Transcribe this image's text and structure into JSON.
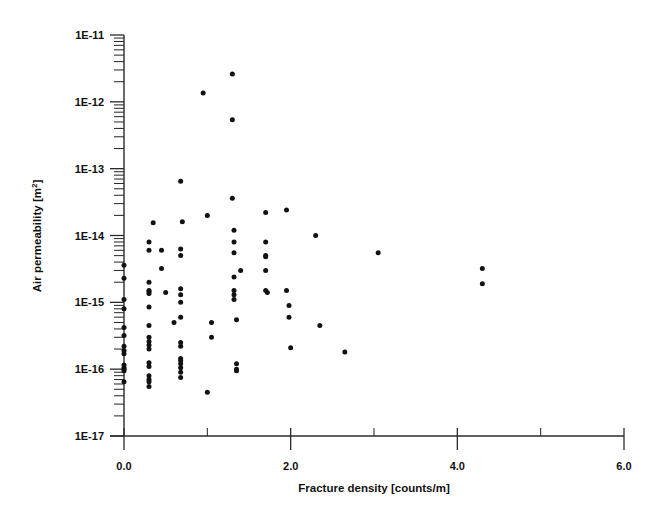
{
  "chart_data": {
    "type": "scatter",
    "title": "",
    "subtitle": "",
    "xlabel": "Fracture density [counts/m]",
    "ylabel": "Air permeability [m²]",
    "ylabel_base": "Air permeability [m",
    "ylabel_exponent": "2",
    "ylabel_close": "]",
    "xscale": "linear",
    "yscale": "log",
    "xlim": [
      0.0,
      6.0
    ],
    "ylim": [
      1e-17,
      1e-11
    ],
    "grid": false,
    "legend": null,
    "legend_position": "none",
    "marker": {
      "shape": "circle",
      "color": "#121212",
      "size_px": 5
    },
    "x_ticks_major": [
      0.0,
      2.0,
      4.0,
      6.0
    ],
    "x_ticks_major_labels": [
      "0.0",
      "2.0",
      "4.0",
      "6.0"
    ],
    "x_ticks_minor": [
      1.0,
      3.0,
      5.0
    ],
    "y_ticks_major": [
      1e-17,
      1e-16,
      1e-15,
      1e-14,
      1e-13,
      1e-12,
      1e-11
    ],
    "y_ticks_major_labels": [
      "1E-17",
      "1E-16",
      "1E-15",
      "1E-14",
      "1E-13",
      "1E-12",
      "1E-11"
    ],
    "y_minor_multipliers": [
      2,
      3,
      4,
      5,
      6,
      7,
      8,
      9
    ],
    "n_points": 91,
    "points": [
      [
        0.0,
        3.6e-15
      ],
      [
        0.0,
        2.3e-15
      ],
      [
        0.0,
        1.1e-15
      ],
      [
        0.0,
        8e-16
      ],
      [
        0.0,
        4.2e-16
      ],
      [
        0.0,
        3.2e-16
      ],
      [
        0.0,
        2.2e-16
      ],
      [
        0.0,
        1.7e-16
      ],
      [
        0.0,
        1.15e-16
      ],
      [
        0.0,
        1.05e-16
      ],
      [
        0.0,
        9.5e-17
      ],
      [
        0.0,
        6.5e-17
      ],
      [
        0.3,
        8e-15
      ],
      [
        0.3,
        6e-15
      ],
      [
        0.3,
        2e-15
      ],
      [
        0.3,
        1.5e-15
      ],
      [
        0.3,
        1.35e-15
      ],
      [
        0.3,
        8.5e-16
      ],
      [
        0.3,
        4.5e-16
      ],
      [
        0.3,
        2.6e-16
      ],
      [
        0.3,
        2.3e-16
      ],
      [
        0.3,
        2e-16
      ],
      [
        0.3,
        1.25e-16
      ],
      [
        0.3,
        1.1e-16
      ],
      [
        0.3,
        8e-17
      ],
      [
        0.3,
        7e-17
      ],
      [
        0.3,
        5.5e-17
      ],
      [
        0.35,
        1.55e-14
      ],
      [
        0.45,
        6e-15
      ],
      [
        0.45,
        3.2e-15
      ],
      [
        0.5,
        1.4e-15
      ],
      [
        0.6,
        5e-16
      ],
      [
        0.68,
        6.5e-14
      ],
      [
        0.68,
        6.3e-15
      ],
      [
        0.68,
        5e-15
      ],
      [
        0.68,
        1.6e-15
      ],
      [
        0.68,
        1.3e-15
      ],
      [
        0.68,
        1e-15
      ],
      [
        0.68,
        6e-16
      ],
      [
        0.68,
        2.5e-16
      ],
      [
        0.68,
        2.2e-16
      ],
      [
        0.68,
        1.2e-16
      ],
      [
        0.68,
        1.05e-16
      ],
      [
        0.68,
        9e-17
      ],
      [
        0.7,
        1.6e-14
      ],
      [
        0.95,
        1.35e-12
      ],
      [
        1.0,
        2e-14
      ],
      [
        1.0,
        4.5e-17
      ],
      [
        1.05,
        5e-16
      ],
      [
        1.05,
        3e-16
      ],
      [
        1.3,
        2.6e-12
      ],
      [
        1.3,
        5.4e-13
      ],
      [
        1.3,
        3.6e-14
      ],
      [
        1.32,
        1.2e-14
      ],
      [
        1.32,
        8e-15
      ],
      [
        1.32,
        5.5e-15
      ],
      [
        1.32,
        2.4e-15
      ],
      [
        1.32,
        1.5e-15
      ],
      [
        1.32,
        1.3e-15
      ],
      [
        1.35,
        5.5e-16
      ],
      [
        1.35,
        1.2e-16
      ],
      [
        1.35,
        9.5e-17
      ],
      [
        1.4,
        3e-15
      ],
      [
        1.7,
        2.2e-14
      ],
      [
        1.7,
        8e-15
      ],
      [
        1.7,
        5e-15
      ],
      [
        1.7,
        3e-15
      ],
      [
        1.7,
        1.5e-15
      ],
      [
        1.72,
        1.4e-15
      ],
      [
        1.95,
        2.4e-14
      ],
      [
        1.95,
        1.5e-15
      ],
      [
        1.98,
        9e-16
      ],
      [
        1.98,
        6e-16
      ],
      [
        2.0,
        2.1e-16
      ],
      [
        2.3,
        1e-14
      ],
      [
        2.35,
        4.5e-16
      ],
      [
        2.65,
        1.8e-16
      ],
      [
        3.05,
        5.5e-15
      ],
      [
        4.3,
        3.2e-15
      ],
      [
        4.3,
        1.9e-15
      ],
      [
        0.3,
        1.45e-15
      ],
      [
        0.3,
        3e-16
      ],
      [
        0.68,
        1.45e-16
      ],
      [
        0.68,
        1.35e-16
      ],
      [
        0.0,
        1e-16
      ],
      [
        0.0,
        1.9e-16
      ],
      [
        1.32,
        1.1e-15
      ],
      [
        1.35,
        1e-16
      ],
      [
        0.3,
        6.5e-17
      ],
      [
        0.68,
        7.5e-17
      ],
      [
        1.7,
        4.8e-15
      ]
    ]
  },
  "axes": {
    "x_axis_name": "fracture-density-axis",
    "y_axis_name": "air-permeability-axis"
  }
}
